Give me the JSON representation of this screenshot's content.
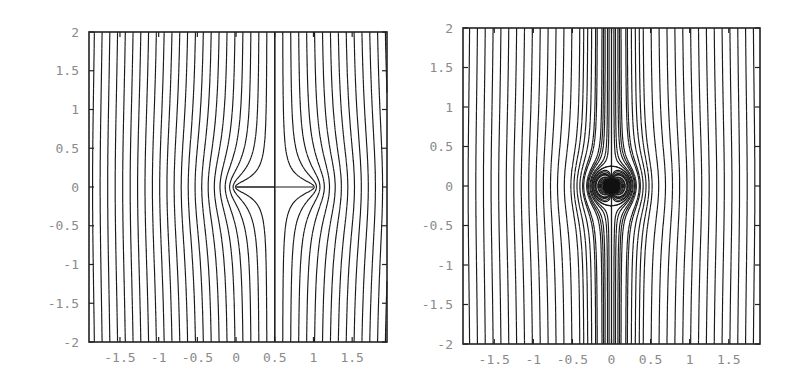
{
  "chart_data": [
    {
      "type": "line",
      "title": "",
      "description": "Streamlines of uniform vertical flow deflected by a slit/plate between x=0 and x=1 (level curves of Re(sqrt(z(z-1))))",
      "xlabel": "",
      "ylabel": "",
      "xlim": [
        -1.9,
        1.95
      ],
      "ylim": [
        -2,
        2
      ],
      "grid": false,
      "legend": null,
      "x_ticks": [
        "-1.5",
        "-1",
        "-0.5",
        "0",
        "0.5",
        "1",
        "1.5"
      ],
      "x_tick_values": [
        -1.5,
        -1,
        -0.5,
        0,
        0.5,
        1,
        1.5
      ],
      "y_ticks": [
        "2",
        "1.5",
        "1",
        "0.5",
        "0",
        "-0.5",
        "-1",
        "-1.5",
        "-2"
      ],
      "y_tick_values": [
        2,
        1.5,
        1,
        0.5,
        0,
        -0.5,
        -1,
        -1.5,
        -2
      ],
      "features": {
        "slit_start": 0,
        "slit_end": 1,
        "center_vertical_line_x": 0.5,
        "horizontal_segment_y": 0,
        "streamline_spacing": 0.1
      },
      "frame_px": {
        "left": 89,
        "right": 387,
        "top": 32,
        "bottom": 342
      }
    },
    {
      "type": "line",
      "title": "",
      "description": "Streamlines of uniform vertical flow with a doublet at the origin (level curves of x*(1 - r0^2/(x^2+y^2)))",
      "xlabel": "",
      "ylabel": "",
      "xlim": [
        -1.9,
        1.9
      ],
      "ylim": [
        -2,
        2
      ],
      "grid": false,
      "legend": null,
      "x_ticks": [
        "-1.5",
        "-1",
        "-0.5",
        "0",
        "0.5",
        "1",
        "1.5"
      ],
      "x_tick_values": [
        -1.5,
        -1,
        -0.5,
        0,
        0.5,
        1,
        1.5
      ],
      "y_ticks": [
        "2",
        "1.5",
        "1",
        "0.5",
        "0",
        "-0.5",
        "-1",
        "-1.5",
        "-2"
      ],
      "y_tick_values": [
        2,
        1.5,
        1,
        0.5,
        0,
        -0.5,
        -1,
        -1.5,
        -2
      ],
      "features": {
        "doublet_center": [
          0,
          0
        ],
        "separating_circle_radius": 0.25,
        "center_vertical_line_x": 0,
        "streamline_spacing": 0.1
      },
      "frame_px": {
        "left": 463,
        "right": 760,
        "top": 28,
        "bottom": 344
      }
    }
  ],
  "colors": {
    "line": "#1a1a1a",
    "frame": "#222222",
    "tick_label": "#8a8a8a",
    "background": "#ffffff"
  }
}
